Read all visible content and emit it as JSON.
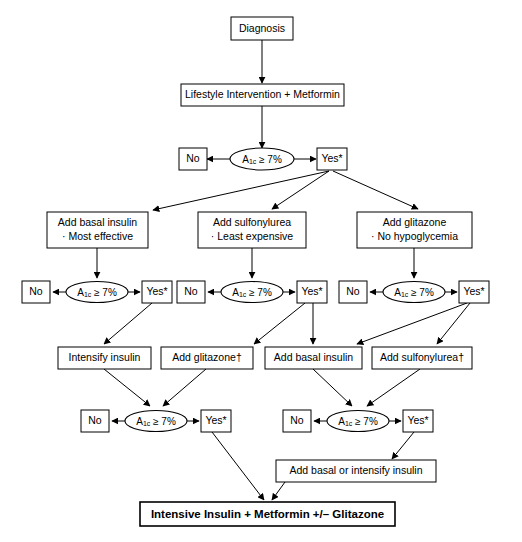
{
  "diagram": {
    "colors": {
      "line": "#000000",
      "box_fill": "#ffffff",
      "text": "#000000"
    },
    "decision_label_prefix": "A",
    "decision_label_sub": "1c",
    "decision_label_suffix": " ≥ 7%",
    "yes_label": "Yes",
    "yes_marker": "*",
    "no_label": "No",
    "dagger": "†",
    "nodes": {
      "start": {
        "label": "Diagnosis"
      },
      "lifestyle": {
        "label": "Lifestyle Intervention + Metformin"
      },
      "decision_1": {
        "label": "A1c ≥ 7%"
      },
      "no_1": {
        "label": "No"
      },
      "yes_1": {
        "label": "Yes*"
      },
      "basal_insulin": {
        "line1": "Add basal insulin",
        "line2": "· Most effective"
      },
      "sulfonylurea": {
        "line1": "Add sulfonylurea",
        "line2": "· Least expensive"
      },
      "glitazone": {
        "line1": "Add glitazone",
        "line2": "· No hypoglycemia"
      },
      "decision_2a": {
        "label": "A1c ≥ 7%"
      },
      "no_2a": {
        "label": "No"
      },
      "yes_2a": {
        "label": "Yes*"
      },
      "decision_2b": {
        "label": "A1c ≥ 7%"
      },
      "no_2b": {
        "label": "No"
      },
      "yes_2b": {
        "label": "Yes*"
      },
      "decision_2c": {
        "label": "A1c ≥ 7%"
      },
      "no_2c": {
        "label": "No"
      },
      "yes_2c": {
        "label": "Yes*"
      },
      "intensify_insulin": {
        "label": "Intensify insulin"
      },
      "add_glitazone_dag": {
        "label": "Add glitazone†"
      },
      "add_basal_insulin_2": {
        "label": "Add basal insulin"
      },
      "add_sulfonylurea_dag": {
        "label": "Add sulfonylurea†"
      },
      "decision_3a": {
        "label": "A1c ≥ 7%"
      },
      "no_3a": {
        "label": "No"
      },
      "yes_3a": {
        "label": "Yes*"
      },
      "decision_3b": {
        "label": "A1c ≥ 7%"
      },
      "no_3b": {
        "label": "No"
      },
      "yes_3b": {
        "label": "Yes*"
      },
      "add_basal_or_intensify": {
        "label": "Add basal or intensify insulin"
      },
      "final": {
        "label": "Intensive Insulin + Metformin +/– Glitazone"
      }
    }
  }
}
